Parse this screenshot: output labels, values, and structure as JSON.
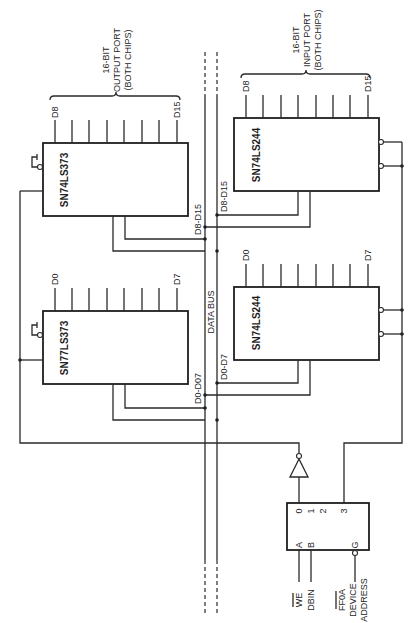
{
  "diagram": {
    "type": "circuit-schematic",
    "orientation": "rotated-90",
    "bus": {
      "label": "DATA BUS",
      "group_labels": [
        "D0-D7",
        "D8-D15",
        "D0-D7",
        "D8-D15"
      ]
    },
    "output_port": {
      "title_lines": [
        "16-BIT",
        "OUTPUT PORT",
        "(BOTH CHIPS)"
      ],
      "chips": [
        {
          "part": "SN74LS373",
          "first_pin": "D8",
          "last_pin": "D15",
          "bus_label": "D8-D15"
        },
        {
          "part": "SN77LS373",
          "first_pin": "D0",
          "last_pin": "D7",
          "bus_label": "D0-D07"
        }
      ]
    },
    "input_port": {
      "title_lines": [
        "16-BIT",
        "INPUT PORT",
        "(BOTH CHIPS)"
      ],
      "chips": [
        {
          "part": "SN74LS244",
          "first_pin": "D8",
          "last_pin": "D15",
          "bus_label": "D8-D15"
        },
        {
          "part": "SN74LS244",
          "first_pin": "D0",
          "last_pin": "D7",
          "bus_label": "D0-D7"
        }
      ]
    },
    "decoder": {
      "inputs": [
        "A",
        "B"
      ],
      "enable": "G",
      "outputs": [
        "0",
        "1",
        "2",
        "3"
      ],
      "signals": {
        "a": "WE",
        "a_overbar": true,
        "b": "DBIN",
        "g_lines": [
          "FF0A",
          "DEVICE",
          "ADDRESS"
        ],
        "g_overbar": true
      }
    }
  }
}
